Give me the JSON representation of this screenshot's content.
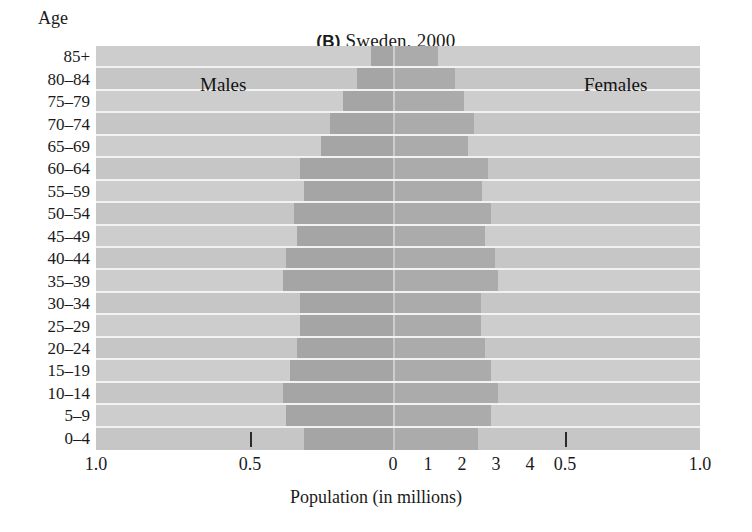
{
  "figure": {
    "panel_letter": "(B)",
    "title_text": "Sweden, 2000",
    "age_header": "Age",
    "x_axis_title": "Population (in millions)",
    "male_series_label": "Males",
    "female_series_label": "Females",
    "background_color": "#cfcfcf",
    "bar_color": "#a8a8a8",
    "gridline_color": "#f2f2f2"
  },
  "chart_data": {
    "type": "bar",
    "subtype": "population-pyramid",
    "title": "(B) Sweden, 2000",
    "xlabel": "Population (in millions)",
    "ylabel": "Age",
    "grid": true,
    "legend_position": "in-plot",
    "categories": [
      "85+",
      "80–84",
      "75–79",
      "70–74",
      "65–69",
      "60–64",
      "55–59",
      "50–54",
      "45–49",
      "40–44",
      "35–39",
      "30–34",
      "25–29",
      "20–24",
      "15–19",
      "10–14",
      "5–9",
      "0–4"
    ],
    "series": [
      {
        "name": "Males",
        "values": [
          0.06,
          0.1,
          0.14,
          0.18,
          0.2,
          0.26,
          0.25,
          0.28,
          0.27,
          0.3,
          0.31,
          0.26,
          0.26,
          0.27,
          0.29,
          0.31,
          0.3,
          0.25
        ]
      },
      {
        "name": "Females",
        "values": [
          0.12,
          0.17,
          0.2,
          0.23,
          0.21,
          0.27,
          0.25,
          0.28,
          0.26,
          0.29,
          0.3,
          0.25,
          0.25,
          0.26,
          0.28,
          0.3,
          0.28,
          0.24
        ]
      }
    ],
    "x_tick_labels_left": [
      "1.0",
      "0.5"
    ],
    "x_tick_labels_center": [
      "0",
      "1",
      "2",
      "3",
      "4"
    ],
    "x_tick_labels_right": [
      "0.5",
      "1.0"
    ],
    "xlim_left": [
      1.0,
      0.0
    ],
    "xlim_right": [
      0.0,
      1.0
    ]
  },
  "x_axis": {
    "ticks": [
      {
        "label": "1.0",
        "x": 96,
        "mark": false
      },
      {
        "label": "0.5",
        "x": 250,
        "mark": true
      },
      {
        "label": "0",
        "x": 393,
        "mark": false
      },
      {
        "label": "1",
        "x": 428,
        "mark": false
      },
      {
        "label": "2",
        "x": 462,
        "mark": false
      },
      {
        "label": "3",
        "x": 496,
        "mark": false
      },
      {
        "label": "4",
        "x": 530,
        "mark": false
      },
      {
        "label": "0.5",
        "x": 565,
        "mark": true
      },
      {
        "label": "1.0",
        "x": 700,
        "mark": false
      }
    ]
  },
  "rows": [
    {
      "age": "85+",
      "male_px": 22,
      "female_px": 43
    },
    {
      "age": "80–84",
      "male_px": 36,
      "female_px": 60
    },
    {
      "age": "75–79",
      "male_px": 50,
      "female_px": 69
    },
    {
      "age": "70–74",
      "male_px": 63,
      "female_px": 79
    },
    {
      "age": "65–69",
      "male_px": 72,
      "female_px": 73
    },
    {
      "age": "60–64",
      "male_px": 93,
      "female_px": 93
    },
    {
      "age": "55–59",
      "male_px": 89,
      "female_px": 87
    },
    {
      "age": "50–54",
      "male_px": 99,
      "female_px": 96
    },
    {
      "age": "45–49",
      "male_px": 96,
      "female_px": 90
    },
    {
      "age": "40–44",
      "male_px": 107,
      "female_px": 100
    },
    {
      "age": "35–39",
      "male_px": 110,
      "female_px": 103
    },
    {
      "age": "30–34",
      "male_px": 93,
      "female_px": 86
    },
    {
      "age": "25–29",
      "male_px": 93,
      "female_px": 86
    },
    {
      "age": "20–24",
      "male_px": 96,
      "female_px": 90
    },
    {
      "age": "15–19",
      "male_px": 103,
      "female_px": 96
    },
    {
      "age": "10–14",
      "male_px": 110,
      "female_px": 103
    },
    {
      "age": "5–9",
      "male_px": 107,
      "female_px": 96
    },
    {
      "age": "0–4",
      "male_px": 89,
      "female_px": 83
    }
  ]
}
